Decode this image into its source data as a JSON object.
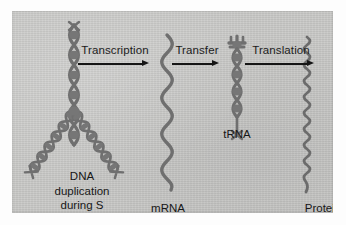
{
  "figure": {
    "panel_background_color": "#c9c9c7",
    "molecule_color": "#6e6e6e",
    "text_color": "#1c1c1c"
  },
  "processes": [
    {
      "id": "transcription",
      "label": "Transcription",
      "arrow": "arrow-right-icon"
    },
    {
      "id": "transfer",
      "label": "Transfer",
      "arrow": "arrow-right-icon"
    },
    {
      "id": "translation",
      "label": "Translation",
      "arrow": "arrow-right-icon"
    }
  ],
  "molecules": [
    {
      "id": "dna",
      "shape": "dna-double-helix-replication-fork",
      "caption_line1": "DNA",
      "caption_line2": "duplication",
      "caption_line3": "during S"
    },
    {
      "id": "mrna",
      "shape": "single-strand-zigzag",
      "caption": "mRNA"
    },
    {
      "id": "trna",
      "shape": "short-helix-with-cloverleaf",
      "caption": "tRNA"
    },
    {
      "id": "protein",
      "shape": "thin-wavy-chain",
      "caption": "Protein"
    }
  ]
}
